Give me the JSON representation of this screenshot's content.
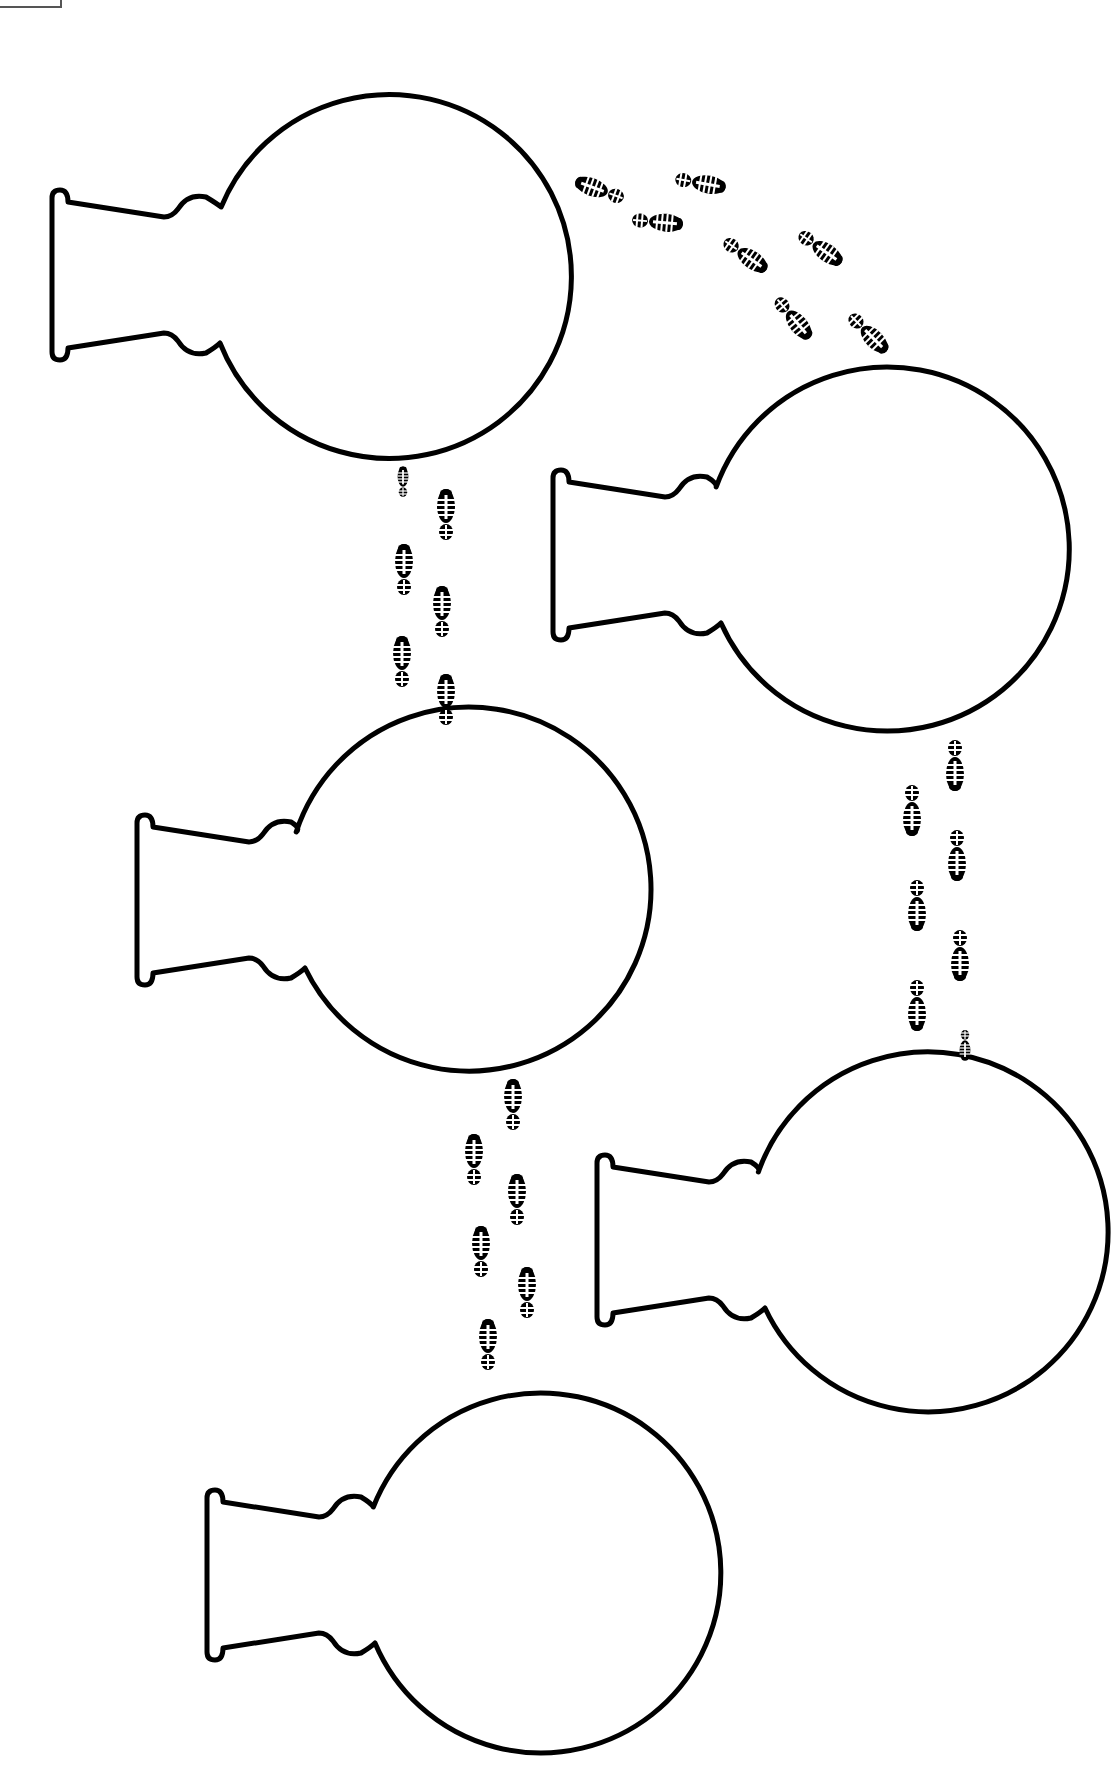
{
  "canvas": {
    "width": 1120,
    "height": 1780,
    "background": "#ffffff",
    "ink": "#000000"
  },
  "corner_box": {
    "present": true
  },
  "flasks": [
    {
      "id": "flask-1",
      "lip_x": 52,
      "neck_cy": 275,
      "bulb_cx": 390,
      "bulb_cy": 275,
      "r": 182
    },
    {
      "id": "flask-2",
      "lip_x": 553,
      "neck_cy": 555,
      "bulb_cx": 885,
      "bulb_cy": 555,
      "r": 182
    },
    {
      "id": "flask-3",
      "lip_x": 137,
      "neck_cy": 900,
      "bulb_cx": 465,
      "bulb_cy": 900,
      "r": 182
    },
    {
      "id": "flask-4",
      "lip_x": 597,
      "neck_cy": 1240,
      "bulb_cx": 925,
      "bulb_cy": 1240,
      "r": 180
    },
    {
      "id": "flask-5",
      "lip_x": 207,
      "neck_cy": 1575,
      "bulb_cx": 540,
      "bulb_cy": 1575,
      "r": 180
    }
  ],
  "footprint_trails": [
    {
      "id": "trail-1-to-2",
      "direction": "arc-right-down",
      "prints": [
        {
          "x": 600,
          "y": 190,
          "rot": -70
        },
        {
          "x": 700,
          "y": 183,
          "rot": 100
        },
        {
          "x": 657,
          "y": 222,
          "rot": 95
        },
        {
          "x": 745,
          "y": 255,
          "rot": 125
        },
        {
          "x": 820,
          "y": 248,
          "rot": 125
        },
        {
          "x": 793,
          "y": 318,
          "rot": 140
        },
        {
          "x": 868,
          "y": 333,
          "rot": 135
        }
      ]
    },
    {
      "id": "trail-3-to-1",
      "direction": "up",
      "prints": [
        {
          "x": 403,
          "y": 482,
          "rot": 0,
          "partial": true
        },
        {
          "x": 446,
          "y": 515,
          "rot": 0
        },
        {
          "x": 404,
          "y": 570,
          "rot": 0
        },
        {
          "x": 442,
          "y": 612,
          "rot": 0
        },
        {
          "x": 402,
          "y": 662,
          "rot": 0
        },
        {
          "x": 446,
          "y": 700,
          "rot": 0
        }
      ]
    },
    {
      "id": "trail-2-to-4",
      "direction": "down",
      "prints": [
        {
          "x": 955,
          "y": 765,
          "rot": 180
        },
        {
          "x": 912,
          "y": 810,
          "rot": 180
        },
        {
          "x": 957,
          "y": 855,
          "rot": 180
        },
        {
          "x": 917,
          "y": 905,
          "rot": 180
        },
        {
          "x": 960,
          "y": 955,
          "rot": 180
        },
        {
          "x": 917,
          "y": 1005,
          "rot": 180
        },
        {
          "x": 965,
          "y": 1045,
          "rot": 180,
          "partial": true
        }
      ]
    },
    {
      "id": "trail-3-to-5",
      "direction": "down",
      "prints": [
        {
          "x": 513,
          "y": 1105,
          "rot": 0
        },
        {
          "x": 474,
          "y": 1160,
          "rot": 0
        },
        {
          "x": 517,
          "y": 1200,
          "rot": 0
        },
        {
          "x": 481,
          "y": 1252,
          "rot": 0
        },
        {
          "x": 527,
          "y": 1293,
          "rot": 0
        },
        {
          "x": 488,
          "y": 1345,
          "rot": 0
        }
      ]
    }
  ]
}
